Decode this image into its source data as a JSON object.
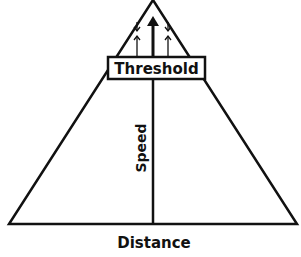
{
  "diagram": {
    "type": "pyramid",
    "colors": {
      "stroke": "#111111",
      "background": "#ffffff"
    },
    "threshold_box": {
      "label": "Threshold"
    },
    "axes": {
      "vertical_label": "Speed",
      "horizontal_label": "Distance"
    },
    "arrows": [
      {
        "name": "left-converging-arrows",
        "description": "down arrow meeting up arrow"
      },
      {
        "name": "center-up-arrow",
        "description": "thick arrow pointing up to apex"
      },
      {
        "name": "right-converging-arrows",
        "description": "down arrow meeting up arrow"
      }
    ]
  }
}
